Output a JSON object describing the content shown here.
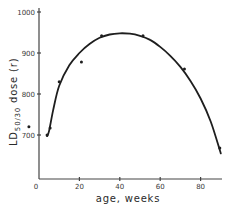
{
  "chart_data": {
    "type": "scatter",
    "title": "",
    "xlabel": "age, weeks",
    "ylabel": "LD50/30 dose (r)",
    "ylabel_parts": {
      "main": "LD",
      "sub": "50/30",
      "rest": " dose (r)"
    },
    "xlim": [
      0,
      90
    ],
    "ylim": [
      620,
      1000
    ],
    "x_ticks": [
      0,
      20,
      40,
      60,
      80
    ],
    "x_tick_labels": [
      "0",
      "20",
      "40",
      "60",
      "80"
    ],
    "y_ticks": [
      700,
      800,
      900,
      1000
    ],
    "y_tick_labels": [
      "700",
      "800",
      "900",
      "1000"
    ],
    "grid": false,
    "legend": null,
    "series": [
      {
        "name": "observed",
        "kind": "points",
        "points": [
          {
            "x": -5,
            "y": 720
          },
          {
            "x": 4,
            "y": 700
          },
          {
            "x": 5.5,
            "y": 717
          },
          {
            "x": 10,
            "y": 830
          },
          {
            "x": 21,
            "y": 878
          },
          {
            "x": 31,
            "y": 942
          },
          {
            "x": 51.5,
            "y": 942
          },
          {
            "x": 72,
            "y": 861
          },
          {
            "x": 89.5,
            "y": 668
          }
        ]
      },
      {
        "name": "fitted curve",
        "kind": "line",
        "points": [
          {
            "x": 4,
            "y": 697
          },
          {
            "x": 5,
            "y": 710
          },
          {
            "x": 7,
            "y": 760
          },
          {
            "x": 10,
            "y": 820
          },
          {
            "x": 15,
            "y": 870
          },
          {
            "x": 20,
            "y": 900
          },
          {
            "x": 25,
            "y": 922
          },
          {
            "x": 30,
            "y": 937
          },
          {
            "x": 35,
            "y": 945
          },
          {
            "x": 40,
            "y": 948
          },
          {
            "x": 45,
            "y": 947
          },
          {
            "x": 50,
            "y": 942
          },
          {
            "x": 55,
            "y": 932
          },
          {
            "x": 60,
            "y": 915
          },
          {
            "x": 65,
            "y": 893
          },
          {
            "x": 70,
            "y": 866
          },
          {
            "x": 75,
            "y": 832
          },
          {
            "x": 80,
            "y": 789
          },
          {
            "x": 85,
            "y": 733
          },
          {
            "x": 90,
            "y": 655
          }
        ]
      }
    ]
  },
  "layout": {
    "plot_left": 39,
    "plot_bottom": 179,
    "plot_right": 222,
    "px_per_x": 2.02,
    "y_px_at_1000": 12,
    "px_per_100y": 41
  }
}
